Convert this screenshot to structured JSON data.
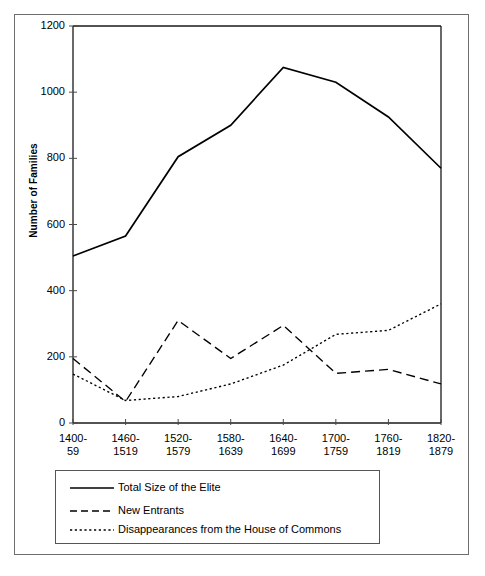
{
  "figure": {
    "background_color": "#ffffff",
    "border_color": "#6e6e6e",
    "line_color": "#000000"
  },
  "axes": {
    "ylabel": "Number of Families",
    "yticks": [
      "0",
      "200",
      "400",
      "600",
      "800",
      "1000",
      "1200"
    ],
    "xticks": [
      {
        "line1": "1400-",
        "line2": "59"
      },
      {
        "line1": "1460-",
        "line2": "1519"
      },
      {
        "line1": "1520-",
        "line2": "1579"
      },
      {
        "line1": "1580-",
        "line2": "1639"
      },
      {
        "line1": "1640-",
        "line2": "1699"
      },
      {
        "line1": "1700-",
        "line2": "1759"
      },
      {
        "line1": "1760-",
        "line2": "1819"
      },
      {
        "line1": "1820-",
        "line2": "1879"
      }
    ]
  },
  "legend": {
    "items": [
      {
        "label": "Total Size of the Elite",
        "style": "solid"
      },
      {
        "label": "New Entrants",
        "style": "dashed"
      },
      {
        "label": "Disappearances from the House of Commons",
        "style": "dotted"
      }
    ]
  },
  "chart_data": {
    "type": "line",
    "title": "",
    "xlabel": "",
    "ylabel": "Number of Families",
    "categories": [
      "1400-59",
      "1460-1519",
      "1520-1579",
      "1580-1639",
      "1640-1699",
      "1700-1759",
      "1760-1819",
      "1820-1879"
    ],
    "ylim": [
      0,
      1200
    ],
    "ytick_step": 200,
    "grid": false,
    "legend_position": "below-plot",
    "series": [
      {
        "name": "Total Size of the Elite",
        "style": "solid",
        "values": [
          505,
          565,
          805,
          900,
          1075,
          1030,
          925,
          770
        ]
      },
      {
        "name": "New Entrants",
        "style": "dashed",
        "values": [
          195,
          65,
          310,
          195,
          295,
          150,
          162,
          118
        ]
      },
      {
        "name": "Disappearances from the House of Commons",
        "style": "dotted",
        "values": [
          148,
          68,
          80,
          118,
          175,
          268,
          280,
          360
        ]
      }
    ]
  }
}
